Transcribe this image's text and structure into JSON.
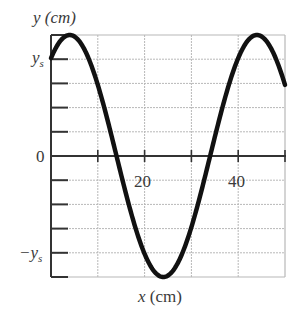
{
  "chart_data": {
    "type": "line",
    "title": "",
    "xlabel": "x (cm)",
    "ylabel": "y (cm)",
    "xlim": [
      0,
      50
    ],
    "ylim": [
      -1.25,
      1.25
    ],
    "y_units": "ys",
    "x_ticks": [
      10,
      20,
      30,
      40,
      50
    ],
    "x_tick_labels": [
      {
        "value": 20,
        "label": "20"
      },
      {
        "value": 40,
        "label": "40"
      }
    ],
    "y_tick_labels": [
      {
        "value": 1.0,
        "label": "y_s"
      },
      {
        "value": 0,
        "label": "0"
      },
      {
        "value": -1.0,
        "label": "-y_s"
      }
    ],
    "y_grid_step": 0.25,
    "x_grid_step": 10,
    "grid": true,
    "legend": null,
    "series": [
      {
        "name": "y(x) waveform",
        "description": "sinusoid, amplitude 1.25 ys, wavelength 40 cm, crest at x≈4 cm",
        "amplitude": 1.25,
        "wavelength": 40,
        "crest_x": 4,
        "x": [
          0,
          4,
          14,
          24,
          34,
          44,
          50
        ],
        "y": [
          1.01,
          1.25,
          0,
          -1.25,
          0,
          1.25,
          0.73
        ]
      }
    ],
    "colors": {
      "curve": "#111111",
      "axis": "#333333",
      "grid": "#b8b8b8"
    }
  },
  "labels": {
    "y_axis": "y (cm)",
    "x_axis": "x (cm)",
    "ys": "y",
    "ys_sub": "s",
    "neg_ys": "−y",
    "neg_ys_sub": "s",
    "zero": "0",
    "tick20": "20",
    "tick40": "40"
  }
}
